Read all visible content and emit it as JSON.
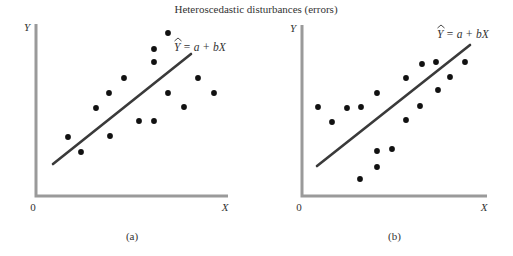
{
  "title": "Heteroscedastic disturbances (errors)",
  "colors": {
    "axis": "#9a9a9a",
    "regression_line": "#3a3a3a",
    "points": "#111111",
    "text": "#333333",
    "background": "#ffffff"
  },
  "panels": [
    {
      "id": "a",
      "caption": "(a)",
      "y_axis_label": "Y",
      "x_axis_label": "X",
      "origin_label": "0",
      "equation": {
        "yhat": "Y",
        "rest": "= a + bX"
      },
      "axes": {
        "x0": 36,
        "y0": 196,
        "x_end": 228,
        "y_top": 24
      },
      "line": {
        "x1": 53,
        "y1": 164,
        "x2": 191,
        "y2": 54
      },
      "eq_pos": {
        "x": 174,
        "y": 51
      },
      "points": [
        [
          168,
          33
        ],
        [
          154,
          49
        ],
        [
          154,
          62
        ],
        [
          124,
          78
        ],
        [
          109,
          93
        ],
        [
          198,
          78
        ],
        [
          168,
          93
        ],
        [
          214,
          93
        ],
        [
          96,
          108
        ],
        [
          184,
          107
        ],
        [
          139,
          121
        ],
        [
          154,
          121
        ],
        [
          68,
          137
        ],
        [
          110,
          136
        ],
        [
          81,
          152
        ]
      ]
    },
    {
      "id": "b",
      "caption": "(b)",
      "y_axis_label": "Y",
      "x_axis_label": "X",
      "origin_label": "0",
      "equation": {
        "yhat": "Y",
        "rest": "= a + bX"
      },
      "axes": {
        "x0": 302,
        "y0": 196,
        "x_end": 487,
        "y_top": 25
      },
      "line": {
        "x1": 317,
        "y1": 166,
        "x2": 470,
        "y2": 45
      },
      "eq_pos": {
        "x": 437,
        "y": 38
      },
      "points": [
        [
          318,
          107
        ],
        [
          332,
          122
        ],
        [
          347,
          108
        ],
        [
          361,
          107
        ],
        [
          377,
          93
        ],
        [
          406,
          78
        ],
        [
          422,
          64
        ],
        [
          436,
          62
        ],
        [
          465,
          62
        ],
        [
          450,
          77
        ],
        [
          438,
          90
        ],
        [
          420,
          106
        ],
        [
          406,
          120
        ],
        [
          392,
          149
        ],
        [
          377,
          151
        ],
        [
          377,
          167
        ],
        [
          360,
          179
        ]
      ]
    }
  ],
  "chart_data": [
    {
      "type": "scatter",
      "title": "Heteroscedastic disturbances (errors)",
      "subtitle": "(a)",
      "xlabel": "X",
      "ylabel": "Y",
      "origin_label": "0",
      "grid": false,
      "annotation": "Ŷ = a + bX (fitted regression line)",
      "note": "Spread of points around the line increases with X",
      "approx_points_0_to_10_scale": [
        [
          6.9,
          9.5
        ],
        [
          6.2,
          8.6
        ],
        [
          6.2,
          7.8
        ],
        [
          4.6,
          6.9
        ],
        [
          3.8,
          6.0
        ],
        [
          8.4,
          6.9
        ],
        [
          6.9,
          6.0
        ],
        [
          9.2,
          6.0
        ],
        [
          3.1,
          5.1
        ],
        [
          7.7,
          5.2
        ],
        [
          5.4,
          4.4
        ],
        [
          6.2,
          4.4
        ],
        [
          1.7,
          3.4
        ],
        [
          3.9,
          3.5
        ],
        [
          2.3,
          2.6
        ]
      ],
      "regression_line": {
        "x": [
          0.9,
          8.1
        ],
        "y": [
          1.9,
          8.3
        ]
      }
    },
    {
      "type": "scatter",
      "title": "Heteroscedastic disturbances (errors)",
      "subtitle": "(b)",
      "xlabel": "X",
      "ylabel": "Y",
      "origin_label": "0",
      "grid": false,
      "annotation": "Ŷ = a + bX (fitted regression line)",
      "note": "Spread of points around the line varies across X",
      "approx_points_0_to_10_scale": [
        [
          0.9,
          5.1
        ],
        [
          1.6,
          4.3
        ],
        [
          2.4,
          5.1
        ],
        [
          3.2,
          5.1
        ],
        [
          4.0,
          6.0
        ],
        [
          5.6,
          6.9
        ],
        [
          6.5,
          7.7
        ],
        [
          7.2,
          7.8
        ],
        [
          8.8,
          7.8
        ],
        [
          8.0,
          6.9
        ],
        [
          7.3,
          6.1
        ],
        [
          6.3,
          5.2
        ],
        [
          5.6,
          4.4
        ],
        [
          4.8,
          2.7
        ],
        [
          4.0,
          2.6
        ],
        [
          4.0,
          1.7
        ],
        [
          3.1,
          1.0
        ]
      ],
      "regression_line": {
        "x": [
          0.8,
          9.1
        ],
        "y": [
          1.7,
          8.8
        ]
      }
    }
  ]
}
